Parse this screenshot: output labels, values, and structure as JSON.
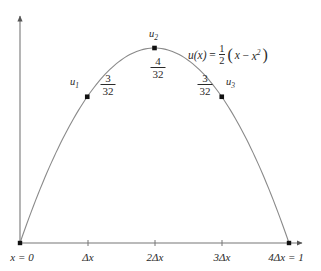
{
  "chart_data": {
    "type": "line",
    "title": "",
    "xlabel": "",
    "ylabel": "",
    "equation_text": "u(x) = 1/2 (x - x^2)",
    "equation_parts": {
      "lhs": "u(x)",
      "equals": "=",
      "frac_num": "1",
      "frac_den": "2",
      "open_paren": "(",
      "body_x": "x",
      "minus": "−",
      "body_x2_base": "x",
      "body_x2_exp": "2",
      "close_paren": ")"
    },
    "x": [
      0,
      0.25,
      0.5,
      0.75,
      1
    ],
    "values": [
      0,
      0.09375,
      0.125,
      0.09375,
      0
    ],
    "xlim": [
      0,
      1
    ],
    "ylim": [
      0,
      0.14
    ],
    "grid": false,
    "legend": false,
    "curve_color": "#8a8a8a",
    "point_color": "#111111",
    "axis_color": "#555555",
    "sample_points": [
      {
        "id": "u1",
        "label": "u",
        "sub": "1",
        "x_value": 0.25,
        "y_value": 0.09375,
        "num": "3",
        "den": "32"
      },
      {
        "id": "u2",
        "label": "u",
        "sub": "2",
        "x_value": 0.5,
        "y_value": 0.125,
        "num": "4",
        "den": "32"
      },
      {
        "id": "u3",
        "label": "u",
        "sub": "3",
        "x_value": 0.75,
        "y_value": 0.09375,
        "num": "3",
        "den": "32"
      }
    ],
    "x_tick_labels": [
      "x = 0",
      "Δx",
      "2Δx",
      "3Δx",
      "4Δx = 1"
    ]
  },
  "axis": {
    "origin_label": "x = 0",
    "tick1_label": "Δx",
    "tick2_label": "2Δx",
    "tick3_label": "3Δx",
    "tick4_label": "4Δx = 1"
  },
  "nodes": {
    "u1": {
      "name": "u",
      "index": "1",
      "num": "3",
      "den": "32"
    },
    "u2": {
      "name": "u",
      "index": "2",
      "num": "4",
      "den": "32"
    },
    "u3": {
      "name": "u",
      "index": "3",
      "num": "3",
      "den": "32"
    }
  }
}
